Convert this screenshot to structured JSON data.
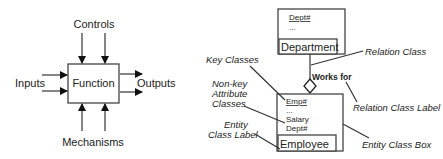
{
  "idef0": {
    "function_label": "Function",
    "controls_label": "Controls",
    "inputs_label": "Inputs",
    "outputs_label": "Outputs",
    "mechanisms_label": "Mechanisms"
  },
  "entity_diagram": {
    "department": {
      "key_attribute": "Dept#",
      "ellipsis": "...",
      "class_label": "Department"
    },
    "employee": {
      "key_attribute": "Emp#",
      "ellipsis": "...",
      "attributes": [
        "Salary",
        "Dept#"
      ],
      "class_label": "Employee"
    },
    "relation_label": "Works for",
    "annotations": {
      "relation_class": "Relation Class",
      "key_classes": "Key Classes",
      "non_key_line1": "Non-key",
      "non_key_line2": "Attribute",
      "non_key_line3": "Classes",
      "relation_class_label": "Relation Class Label",
      "entity_line1": "Entity",
      "entity_line2": "Class Label",
      "entity_class_box": "Entity Class Box"
    }
  }
}
